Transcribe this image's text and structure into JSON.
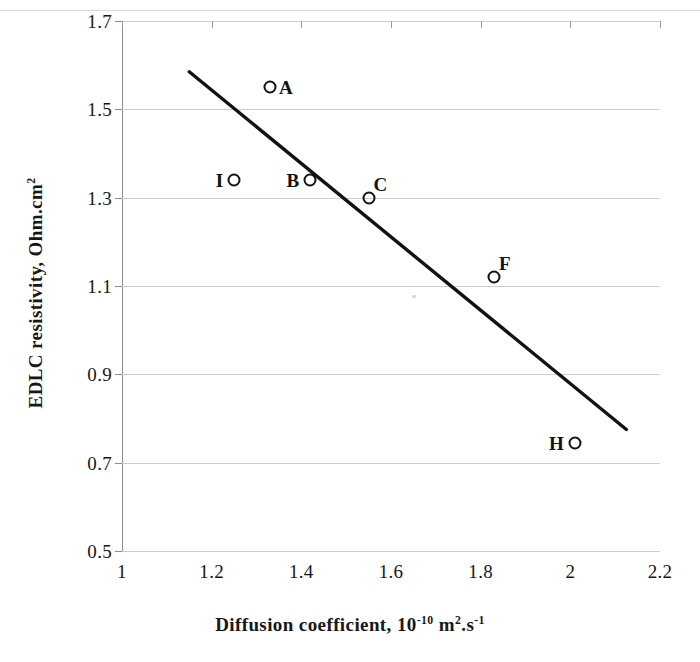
{
  "chart_data": {
    "type": "scatter",
    "title": "",
    "xlabel": "Diffusion coefficient, 10-10 m2.s-1",
    "xlabel_parts": {
      "pre": "Diffusion coefficient, 10",
      "exp1": "-10",
      "mid": " m",
      "exp2": "2",
      "post": ".s",
      "exp3": "-1"
    },
    "ylabel": "EDLC resistivity, Ohm.cm2",
    "ylabel_parts": {
      "pre": "EDLC resistivity, Ohm.cm",
      "exp": "2"
    },
    "xlim": [
      1,
      2.2
    ],
    "ylim": [
      0.5,
      1.7
    ],
    "xticks": [
      "1",
      "1.2",
      "1.4",
      "1.6",
      "1.8",
      "2",
      "2.2"
    ],
    "xtick_values": [
      1,
      1.2,
      1.4,
      1.6,
      1.8,
      2,
      2.2
    ],
    "yticks": [
      "0.5",
      "0.7",
      "0.9",
      "1.1",
      "1.3",
      "1.5",
      "1.7"
    ],
    "ytick_values": [
      0.5,
      0.7,
      0.9,
      1.1,
      1.3,
      1.5,
      1.7
    ],
    "grid": "horizontal",
    "legend": "none",
    "marker_style": "open-circle",
    "marker_color": "#121212",
    "trendline": {
      "style": "solid",
      "color": "#121212",
      "x_start": 1.15,
      "y_start": 1.585,
      "x_end": 2.125,
      "y_end": 0.775
    },
    "points": [
      {
        "label": "A",
        "x": 1.33,
        "y": 1.55,
        "label_pos": "right"
      },
      {
        "label": "I",
        "x": 1.25,
        "y": 1.34,
        "label_pos": "left"
      },
      {
        "label": "B",
        "x": 1.42,
        "y": 1.34,
        "label_pos": "left"
      },
      {
        "label": "C",
        "x": 1.55,
        "y": 1.3,
        "label_pos": "above-right"
      },
      {
        "label": "F",
        "x": 1.83,
        "y": 1.12,
        "label_pos": "above-right"
      },
      {
        "label": "H",
        "x": 2.01,
        "y": 0.745,
        "label_pos": "left"
      }
    ]
  }
}
